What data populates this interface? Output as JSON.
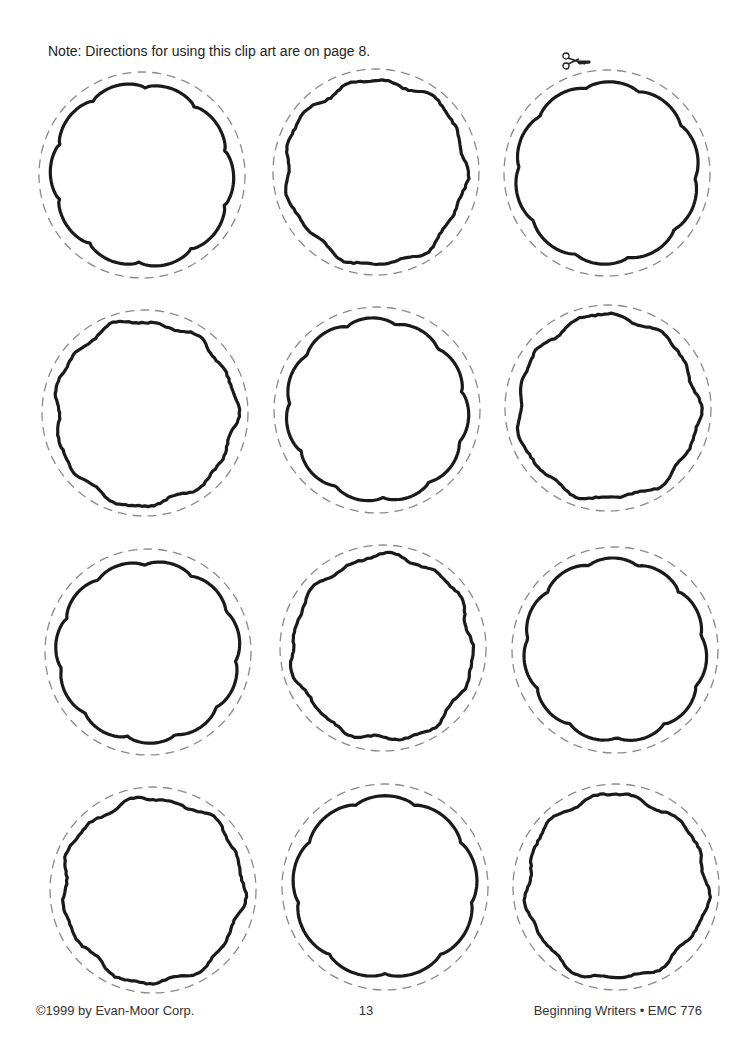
{
  "page": {
    "note": "Note: Directions for using this clip art are on page 8.",
    "footer": {
      "copyright": "©1999 by Evan-Moor Corp.",
      "page_number": "13",
      "series": "Beginning Writers • EMC 776"
    },
    "scissors_icon": "scissors-icon",
    "colors": {
      "frame_stroke": "#1a1a1a",
      "cut_line": "#8a8a8a",
      "background": "#ffffff"
    }
  },
  "frames": [
    {
      "row": 1,
      "col": 1,
      "cx": 142,
      "cy": 175,
      "style": "scalloped"
    },
    {
      "row": 1,
      "col": 2,
      "cx": 376,
      "cy": 172,
      "style": "wobbly"
    },
    {
      "row": 1,
      "col": 3,
      "cx": 607,
      "cy": 173,
      "style": "scalloped"
    },
    {
      "row": 2,
      "col": 1,
      "cx": 145,
      "cy": 413,
      "style": "wobbly"
    },
    {
      "row": 2,
      "col": 2,
      "cx": 377,
      "cy": 410,
      "style": "scalloped"
    },
    {
      "row": 2,
      "col": 3,
      "cx": 608,
      "cy": 408,
      "style": "wobbly"
    },
    {
      "row": 3,
      "col": 1,
      "cx": 148,
      "cy": 652,
      "style": "scalloped"
    },
    {
      "row": 3,
      "col": 2,
      "cx": 383,
      "cy": 648,
      "style": "wobbly"
    },
    {
      "row": 3,
      "col": 3,
      "cx": 615,
      "cy": 650,
      "style": "scalloped"
    },
    {
      "row": 4,
      "col": 1,
      "cx": 153,
      "cy": 890,
      "style": "wobbly"
    },
    {
      "row": 4,
      "col": 2,
      "cx": 385,
      "cy": 887,
      "style": "scalloped"
    },
    {
      "row": 4,
      "col": 3,
      "cx": 616,
      "cy": 887,
      "style": "wobbly"
    }
  ]
}
